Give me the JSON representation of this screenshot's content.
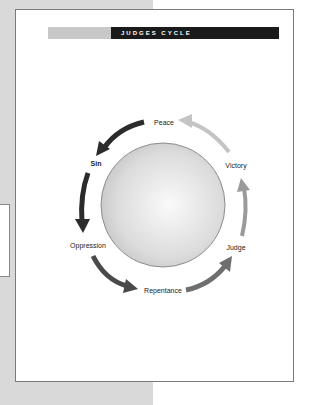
{
  "diagram": {
    "title": "JUDGES CYCLE",
    "stages": [
      {
        "label": "Peace",
        "x": 164,
        "y": 122,
        "bold": false
      },
      {
        "label": "Sin",
        "x": 96,
        "y": 163,
        "bold": true
      },
      {
        "label": "Oppression",
        "x": 88,
        "y": 245,
        "bold": false
      },
      {
        "label": "Repentance",
        "x": 163,
        "y": 290,
        "bold": false
      },
      {
        "label": "Judge",
        "x": 236,
        "y": 247,
        "bold": false
      },
      {
        "label": "Victory",
        "x": 236,
        "y": 165,
        "bold": false
      }
    ],
    "colors": {
      "arrow_dark": "#2b2b2b",
      "arrow_mid": "#555555",
      "arrow_gray": "#8a8a8a",
      "arrow_light": "#c4c4c4",
      "header_black": "#1a1a1a",
      "header_gray": "#c8c8c8"
    }
  }
}
